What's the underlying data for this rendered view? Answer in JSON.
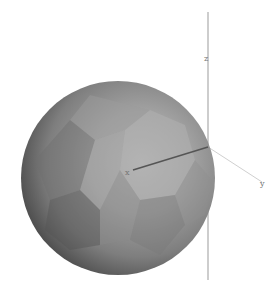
{
  "scene": {
    "background": "#ffffff",
    "sphere": {
      "center": [
        118,
        178
      ],
      "radius": 97,
      "highlight_color": "#b4b4b4",
      "mid_color": "#8c8c8c",
      "shadow_color": "#303030"
    },
    "axes": {
      "origin": [
        208,
        147
      ],
      "x": {
        "label": "x",
        "end": [
          130,
          172
        ],
        "color": "#555555"
      },
      "y": {
        "label": "y",
        "end": [
          262,
          182
        ],
        "color": "#cfcfcf"
      },
      "z": {
        "label": "z",
        "top": [
          208,
          12
        ],
        "bottom": [
          208,
          280
        ],
        "color": "#bdbdbd"
      }
    }
  }
}
